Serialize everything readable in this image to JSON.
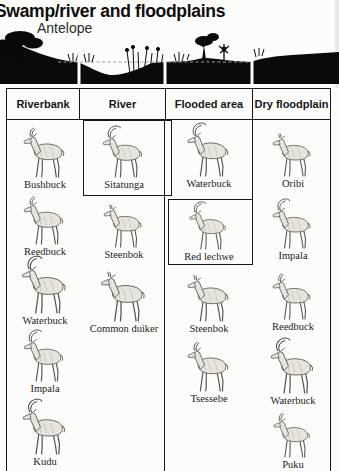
{
  "page": {
    "title": "Swamp/river and floodplains",
    "subtitle": "Antelope"
  },
  "habitat_diagram": {
    "description": "black landscape cross-section silhouette split into four habitat segments aligned with the table columns: wooded riverbank, river depression with reeds and dashed water line, flooded area with shrubs and a tree, grassy dry floodplain"
  },
  "table": {
    "columns": [
      {
        "header": "Riverbank",
        "items": [
          {
            "label": "Bushbuck"
          },
          {
            "label": "Reedbuck"
          },
          {
            "label": "Waterbuck"
          },
          {
            "label": "Impala"
          },
          {
            "label": "Kudu"
          }
        ]
      },
      {
        "header": "River",
        "items": [
          {
            "label": "Sitatunga",
            "boxed": true
          },
          {
            "label": "Steenbok"
          },
          {
            "label": "Common duiker"
          }
        ]
      },
      {
        "header": "Flooded area",
        "items": [
          {
            "label": "Waterbuck"
          },
          {
            "label": "Red lechwe",
            "boxed": true
          },
          {
            "label": "Steenbok"
          },
          {
            "label": "Tsessebe"
          }
        ]
      },
      {
        "header": "Dry floodplain",
        "items": [
          {
            "label": "Oribi"
          },
          {
            "label": "Impala"
          },
          {
            "label": "Reedbuck"
          },
          {
            "label": "Waterbuck"
          },
          {
            "label": "Puku"
          }
        ]
      }
    ]
  },
  "colors": {
    "ink": "#161616",
    "paper": "#fcfcfa",
    "silhouette": "#0a0a0a",
    "sketch_stroke": "#5a564f",
    "sketch_fill": "#e7e4dd"
  }
}
